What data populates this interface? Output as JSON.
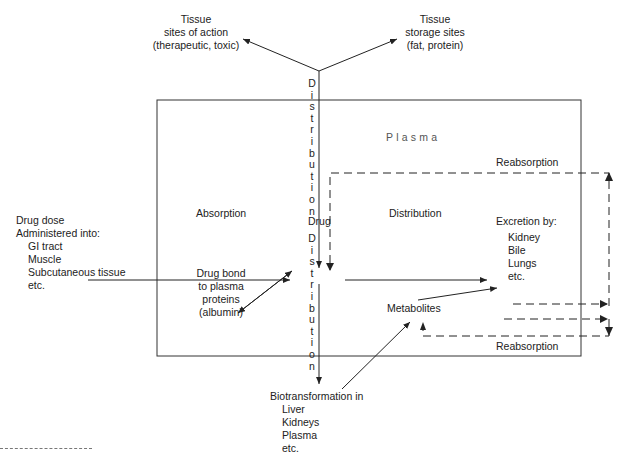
{
  "diagram": {
    "compartment_label": "Plasma",
    "center_node": "Drug",
    "tissue_action": {
      "title": "Tissue",
      "line2": "sites of action",
      "line3": "(therapeutic, toxic)"
    },
    "tissue_storage": {
      "title": "Tissue",
      "line2": "storage sites",
      "line3": "(fat, protein)"
    },
    "distribution_vertical_top": [
      "D",
      "i",
      "s",
      "t",
      "r",
      "i",
      "b",
      "u",
      "t",
      "i",
      "o",
      "n"
    ],
    "distribution_vertical_bottom": [
      "D",
      "i",
      "s",
      "t",
      "r",
      "i",
      "b",
      "u",
      "t",
      "i",
      "o",
      "n"
    ],
    "drug_dose": {
      "line1": "Drug dose",
      "line2": "Administered into:",
      "sites": [
        "GI tract",
        "Muscle",
        "Subcutaneous tissue",
        "etc."
      ]
    },
    "absorption_label": "Absorption",
    "distribution_label": "Distribution",
    "protein_binding": {
      "lines": [
        "Drug bond",
        "to plasma",
        "proteins",
        "(albumin)"
      ]
    },
    "metabolites_label": "Metabolites",
    "excretion": {
      "title": "Excretion by:",
      "routes": [
        "Kidney",
        "Bile",
        "Lungs",
        "etc."
      ]
    },
    "reabsorption_top": "Reabsorption",
    "reabsorption_bottom": "Reabsorption",
    "biotransformation": {
      "title": "Biotransformation in",
      "sites": [
        "Liver",
        "Kidneys",
        "Plasma",
        "etc."
      ]
    },
    "colors": {
      "line": "#222222",
      "background": "#ffffff"
    }
  }
}
